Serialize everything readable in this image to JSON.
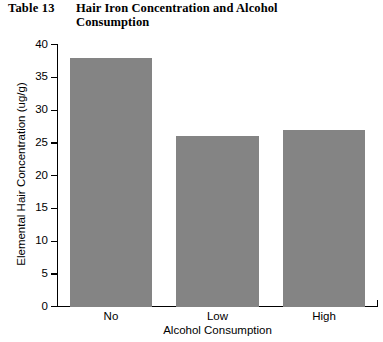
{
  "header": {
    "table_number": "Table 13",
    "title": "Hair Iron Concentration and Alcohol Consumption"
  },
  "chart_data": {
    "type": "bar",
    "title": "Hair Iron Concentration and Alcohol Consumption",
    "categories": [
      "No",
      "Low",
      "High"
    ],
    "values": [
      38,
      26,
      27
    ],
    "xlabel": "Alcohol Consumption",
    "ylabel": "Elemental Hair Concentration (ug/g)",
    "ylim": [
      0,
      40
    ],
    "ytick_labels": [
      "40",
      "35",
      "30",
      "25",
      "20",
      "15",
      "10",
      "5",
      "0"
    ],
    "ytick_values": [
      40,
      35,
      30,
      25,
      20,
      15,
      10,
      5,
      0
    ],
    "grid": false,
    "legend": "none",
    "bar_color": "#848484",
    "axis_color": "#000000",
    "background_color": "#ffffff"
  }
}
